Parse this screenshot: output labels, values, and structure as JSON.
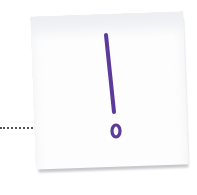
{
  "illustration": {
    "subject": "sticky-note-with-exclamation-mark",
    "glyph": "!",
    "colors": {
      "ink": "#5b3a9a",
      "note": "#fdfdfd",
      "shadow": "#c8c8cc",
      "connector": "#555555"
    }
  }
}
